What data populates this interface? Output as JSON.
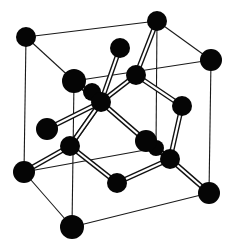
{
  "figure": {
    "title": "Diamond cubic crystal structure (unit cell)",
    "width": 233,
    "height": 247,
    "colors": {
      "atom": "#050505",
      "edge": "#1a1a1a",
      "bond_outline": "#111111",
      "bond_fill": "#ffffff",
      "background": "#ffffff"
    }
  },
  "atoms": [
    {
      "id": "c_tlb",
      "role": "corner",
      "x": 26,
      "y": 37,
      "r": 10
    },
    {
      "id": "c_trb",
      "role": "corner",
      "x": 157,
      "y": 21,
      "r": 10
    },
    {
      "id": "c_trf",
      "role": "corner",
      "x": 211,
      "y": 60,
      "r": 11
    },
    {
      "id": "c_tlf",
      "role": "corner",
      "x": 74,
      "y": 81,
      "r": 12
    },
    {
      "id": "f_top",
      "role": "face-center",
      "x": 120,
      "y": 48,
      "r": 10
    },
    {
      "id": "i_1",
      "role": "interior",
      "x": 136,
      "y": 75,
      "r": 10
    },
    {
      "id": "f_back",
      "role": "face-center",
      "x": 92,
      "y": 92,
      "r": 9
    },
    {
      "id": "i_2",
      "role": "interior",
      "x": 101,
      "y": 102,
      "r": 10
    },
    {
      "id": "f_right",
      "role": "face-center",
      "x": 182,
      "y": 106,
      "r": 10
    },
    {
      "id": "f_left",
      "role": "face-center",
      "x": 47,
      "y": 129,
      "r": 11
    },
    {
      "id": "i_3",
      "role": "interior",
      "x": 70,
      "y": 146,
      "r": 10
    },
    {
      "id": "c_blb",
      "role": "corner-hidden",
      "x": 156,
      "y": 148,
      "r": 8
    },
    {
      "id": "f_front",
      "role": "face-center",
      "x": 146,
      "y": 141,
      "r": 11
    },
    {
      "id": "i_4",
      "role": "interior",
      "x": 170,
      "y": 159,
      "r": 10
    },
    {
      "id": "c_bl",
      "role": "corner",
      "x": 24,
      "y": 172,
      "r": 11
    },
    {
      "id": "f_bottom",
      "role": "face-center",
      "x": 117,
      "y": 183,
      "r": 10
    },
    {
      "id": "c_brf",
      "role": "corner",
      "x": 209,
      "y": 193,
      "r": 11
    },
    {
      "id": "c_blf",
      "role": "corner",
      "x": 72,
      "y": 227,
      "r": 12
    }
  ],
  "cube_edges": [
    [
      26,
      37,
      157,
      21
    ],
    [
      157,
      21,
      211,
      60
    ],
    [
      211,
      60,
      74,
      81
    ],
    [
      74,
      81,
      26,
      37
    ],
    [
      24,
      172,
      156,
      148
    ],
    [
      156,
      148,
      209,
      193
    ],
    [
      209,
      193,
      72,
      227
    ],
    [
      72,
      227,
      24,
      172
    ],
    [
      26,
      37,
      24,
      172
    ],
    [
      157,
      21,
      156,
      148
    ],
    [
      211,
      60,
      209,
      193
    ],
    [
      74,
      81,
      72,
      227
    ]
  ],
  "bonds": [
    [
      157,
      21,
      136,
      75
    ],
    [
      120,
      48,
      101,
      102
    ],
    [
      74,
      81,
      101,
      102
    ],
    [
      136,
      75,
      101,
      102
    ],
    [
      136,
      75,
      182,
      106
    ],
    [
      92,
      92,
      101,
      102
    ],
    [
      101,
      102,
      146,
      141
    ],
    [
      101,
      102,
      70,
      146
    ],
    [
      47,
      129,
      101,
      102
    ],
    [
      70,
      146,
      24,
      172
    ],
    [
      70,
      146,
      117,
      183
    ],
    [
      70,
      146,
      101,
      102
    ],
    [
      182,
      106,
      170,
      159
    ],
    [
      146,
      141,
      170,
      159
    ],
    [
      170,
      159,
      117,
      183
    ],
    [
      170,
      159,
      209,
      193
    ],
    [
      156,
      148,
      170,
      159
    ]
  ]
}
